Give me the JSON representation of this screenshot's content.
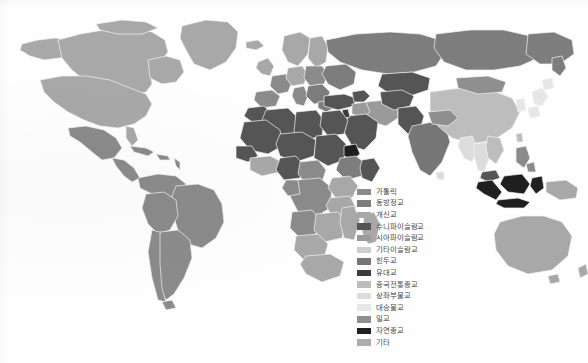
{
  "figure": {
    "type": "choropleth-world-map",
    "background_color": "#fefefe",
    "land_outline_color": "#f2f2f2",
    "projection_note": "world-equirectangular-no-antarctica"
  },
  "legend": {
    "position": "center-right",
    "items": [
      {
        "label": "가톨릭",
        "color": "#8b8b8b"
      },
      {
        "label": "동방정교",
        "color": "#7d7d7d"
      },
      {
        "label": "개신교",
        "color": "#a8a8a8"
      },
      {
        "label": "수니파이슬람교",
        "color": "#555555"
      },
      {
        "label": "시아파이슬람교",
        "color": "#9a9a9a"
      },
      {
        "label": "기타이슬람교",
        "color": "#cfcfcf"
      },
      {
        "label": "힌두교",
        "color": "#777777"
      },
      {
        "label": "유대교",
        "color": "#3a3a3a"
      },
      {
        "label": "중국전통종교",
        "color": "#bdbdbd"
      },
      {
        "label": "상좌부불교",
        "color": "#dcdcdc"
      },
      {
        "label": "대승불교",
        "color": "#e6e6e6"
      },
      {
        "label": "밀교",
        "color": "#8f8f8f"
      },
      {
        "label": "자연종교",
        "color": "#1f1f1f"
      },
      {
        "label": "기타",
        "color": "#adadad"
      }
    ]
  },
  "chart_data": {
    "type": "map",
    "title": "",
    "legend_title": "",
    "categories": [
      "가톨릭",
      "동방정교",
      "개신교",
      "수니파이슬람교",
      "시아파이슬람교",
      "기타이슬람교",
      "힌두교",
      "유대교",
      "중국전통종교",
      "상좌부불교",
      "대승불교",
      "밀교",
      "자연종교",
      "기타"
    ],
    "regions": [
      {
        "name": "캐나다",
        "category": "개신교"
      },
      {
        "name": "미국",
        "category": "개신교"
      },
      {
        "name": "그린란드",
        "category": "개신교"
      },
      {
        "name": "멕시코",
        "category": "가톨릭"
      },
      {
        "name": "중앙아메리카",
        "category": "가톨릭"
      },
      {
        "name": "카리브해",
        "category": "가톨릭"
      },
      {
        "name": "브라질",
        "category": "가톨릭"
      },
      {
        "name": "아르헨티나",
        "category": "가톨릭"
      },
      {
        "name": "칠레",
        "category": "가톨릭"
      },
      {
        "name": "페루",
        "category": "가톨릭"
      },
      {
        "name": "콜롬비아",
        "category": "가톨릭"
      },
      {
        "name": "베네수엘라",
        "category": "가톨릭"
      },
      {
        "name": "영국",
        "category": "개신교"
      },
      {
        "name": "북유럽",
        "category": "개신교"
      },
      {
        "name": "독일",
        "category": "개신교"
      },
      {
        "name": "프랑스",
        "category": "가톨릭"
      },
      {
        "name": "스페인",
        "category": "가톨릭"
      },
      {
        "name": "이탈리아",
        "category": "가톨릭"
      },
      {
        "name": "폴란드",
        "category": "가톨릭"
      },
      {
        "name": "그리스",
        "category": "동방정교"
      },
      {
        "name": "러시아",
        "category": "동방정교"
      },
      {
        "name": "우크라이나",
        "category": "동방정교"
      },
      {
        "name": "터키",
        "category": "수니파이슬람교"
      },
      {
        "name": "북아프리카",
        "category": "수니파이슬람교"
      },
      {
        "name": "사우디아라비아",
        "category": "수니파이슬람교"
      },
      {
        "name": "이란",
        "category": "시아파이슬람교"
      },
      {
        "name": "이라크",
        "category": "시아파이슬람교"
      },
      {
        "name": "이스라엘",
        "category": "유대교"
      },
      {
        "name": "카자흐스탄",
        "category": "수니파이슬람교"
      },
      {
        "name": "파키스탄",
        "category": "수니파이슬람교"
      },
      {
        "name": "인도",
        "category": "힌두교"
      },
      {
        "name": "네팔",
        "category": "힌두교"
      },
      {
        "name": "방글라데시",
        "category": "수니파이슬람교"
      },
      {
        "name": "중국",
        "category": "중국전통종교"
      },
      {
        "name": "몽골",
        "category": "밀교"
      },
      {
        "name": "일본",
        "category": "대승불교"
      },
      {
        "name": "한국",
        "category": "대승불교"
      },
      {
        "name": "태국",
        "category": "상좌부불교"
      },
      {
        "name": "미얀마",
        "category": "상좌부불교"
      },
      {
        "name": "베트남",
        "category": "중국전통종교"
      },
      {
        "name": "인도네시아",
        "category": "수니파이슬람교"
      },
      {
        "name": "말레이시아",
        "category": "수니파이슬람교"
      },
      {
        "name": "필리핀",
        "category": "가톨릭"
      },
      {
        "name": "파푸아뉴기니",
        "category": "개신교"
      },
      {
        "name": "호주",
        "category": "개신교"
      },
      {
        "name": "뉴질랜드",
        "category": "개신교"
      },
      {
        "name": "에티오피아",
        "category": "동방정교"
      },
      {
        "name": "나이지리아",
        "category": "수니파이슬람교"
      },
      {
        "name": "콩고민주공화국",
        "category": "가톨릭"
      },
      {
        "name": "남아프리카공화국",
        "category": "개신교"
      },
      {
        "name": "케냐",
        "category": "개신교"
      },
      {
        "name": "마다가스카르",
        "category": "개신교"
      }
    ]
  }
}
